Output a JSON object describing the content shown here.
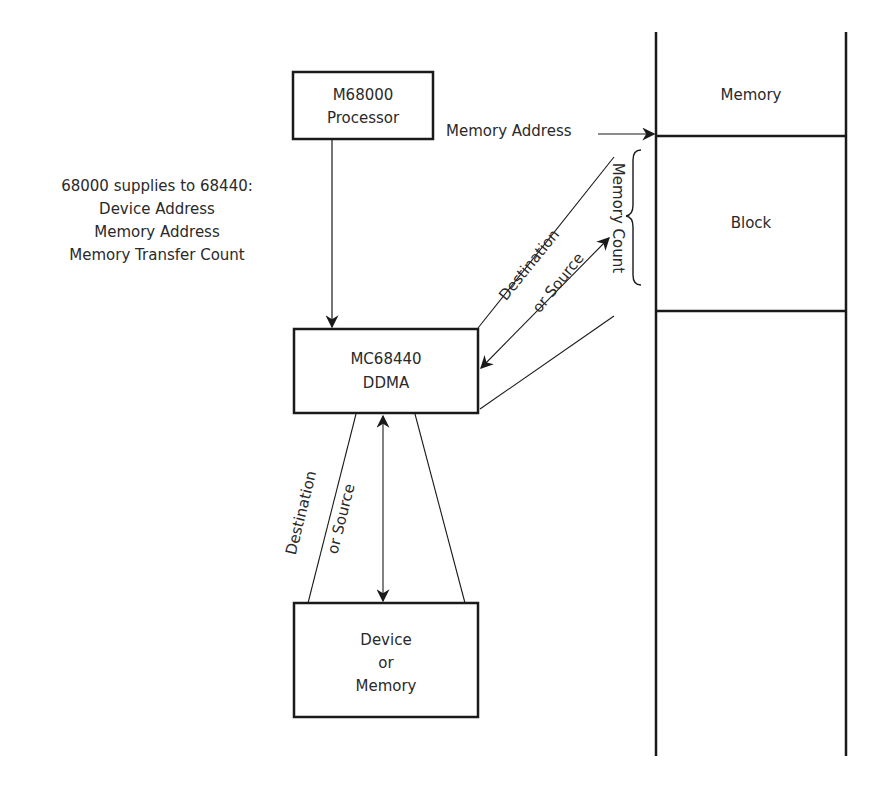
{
  "processor_box": {
    "line1": "M68000",
    "line2": "Processor"
  },
  "supplies_note": {
    "title": "68000 supplies to 68440:",
    "items": [
      "Device Address",
      "Memory Address",
      "Memory Transfer Count"
    ]
  },
  "ddma_box": {
    "line1": "MC68440",
    "line2": "DDMA"
  },
  "device_box": {
    "line1": "Device",
    "line2": "or",
    "line3": "Memory"
  },
  "memory_column": {
    "top_label": "Memory",
    "block_label": "Block"
  },
  "arrows": {
    "memory_address": "Memory Address",
    "upper_dest_line1": "Destination",
    "upper_dest_line2": "or Source",
    "memory_count": "Memory Count",
    "lower_dest_line1": "Destination",
    "lower_dest_line2": "or Source"
  },
  "colors": {
    "stroke": "#1a1a1a",
    "text": "#2a2a2a",
    "background": "#ffffff"
  }
}
